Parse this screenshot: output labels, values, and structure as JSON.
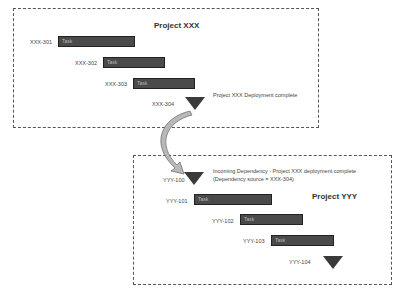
{
  "project_xxx": {
    "title": "Project XXX",
    "tasks": [
      {
        "id": "XXX-301",
        "label": "Task"
      },
      {
        "id": "XXX-302",
        "label": "Task"
      },
      {
        "id": "XXX-303",
        "label": "Task"
      }
    ],
    "milestone": {
      "id": "XXX-304",
      "note": "Project XXX Deployment complete"
    }
  },
  "project_yyy": {
    "title": "Project YYY",
    "incoming": {
      "id": "YYY-100",
      "note_line1": "Incoming Dependency - Project XXX deployment complete",
      "note_line2": "(Dependency source = XXX-304)"
    },
    "tasks": [
      {
        "id": "YYY-101",
        "label": "Task"
      },
      {
        "id": "YYY-102",
        "label": "Task"
      },
      {
        "id": "YYY-103",
        "label": "Task"
      }
    ],
    "milestone": {
      "id": "YYY-104"
    }
  }
}
